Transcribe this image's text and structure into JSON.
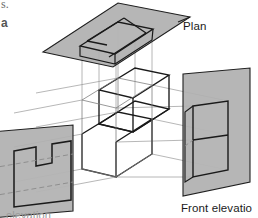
{
  "figure": {
    "type": "orthographic-projection-diagram",
    "labels": {
      "plan": "Plan",
      "front_elevation": "Front elevatio",
      "side_elevation": "elevation",
      "stray_top_1": "s.",
      "stray_top_2": "a"
    },
    "colors": {
      "plane_fill": "#a9a9a9",
      "plane_fill_light": "#b4b4b4",
      "outline": "#1a1a1a",
      "projection_line": "#8d8d8d",
      "hidden_line": "#8a8a8a",
      "background": "#ffffff",
      "label_text": "#1a1a1a"
    },
    "geometry": {
      "plan_plane": {
        "name": "plan-picture-plane",
        "corners": [
          [
            43,
            52
          ],
          [
            118,
            3
          ],
          [
            190,
            17
          ],
          [
            113,
            67
          ]
        ]
      },
      "front_plane": {
        "name": "front-elevation-picture-plane",
        "corners": [
          [
            183,
            74
          ],
          [
            250,
            68
          ],
          [
            250,
            182
          ],
          [
            183,
            196
          ]
        ]
      },
      "side_plane": {
        "name": "side-elevation-picture-plane",
        "corners": [
          [
            -8,
            132
          ],
          [
            73,
            125
          ],
          [
            73,
            211
          ],
          [
            -8,
            218
          ]
        ]
      },
      "plan_view_outline": {
        "name": "plan-view-rectangle",
        "corners": [
          [
            80,
            46
          ],
          [
            118,
            22
          ],
          [
            153,
            29
          ],
          [
            115,
            54
          ]
        ]
      },
      "front_view_outline": {
        "name": "front-elevation-rectangle",
        "corners": [
          [
            193,
            106
          ],
          [
            228,
            101
          ],
          [
            228,
            170
          ],
          [
            193,
            177
          ]
        ]
      },
      "side_view_outline": {
        "name": "side-elevation-notched-profile",
        "points": [
          [
            14,
            151
          ],
          [
            36,
            147
          ],
          [
            36,
            166
          ],
          [
            52,
            163
          ],
          [
            52,
            144
          ],
          [
            71,
            141
          ],
          [
            71,
            200
          ],
          [
            14,
            207
          ]
        ]
      },
      "solid_block": {
        "name": "stepped-solid-object",
        "front_top": [
          [
            82,
            100
          ],
          [
            118,
            78
          ],
          [
            152,
            85
          ],
          [
            116,
            108
          ]
        ],
        "step_face": [
          [
            82,
            134
          ],
          [
            118,
            112
          ],
          [
            152,
            119
          ],
          [
            116,
            141
          ]
        ]
      }
    },
    "counts": {
      "picture_planes": 3,
      "projection_lines": 12
    }
  }
}
